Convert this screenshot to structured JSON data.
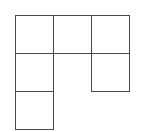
{
  "diagram": {
    "type": "grid-polyomino",
    "cell_size": 38,
    "origin": [
      15,
      15
    ],
    "line_color": "#4a4a4a",
    "background": "#ffffff",
    "cells": [
      {
        "row": 0,
        "col": 0
      },
      {
        "row": 0,
        "col": 1
      },
      {
        "row": 0,
        "col": 2
      },
      {
        "row": 1,
        "col": 0
      },
      {
        "row": 1,
        "col": 2
      },
      {
        "row": 2,
        "col": 0
      }
    ]
  }
}
